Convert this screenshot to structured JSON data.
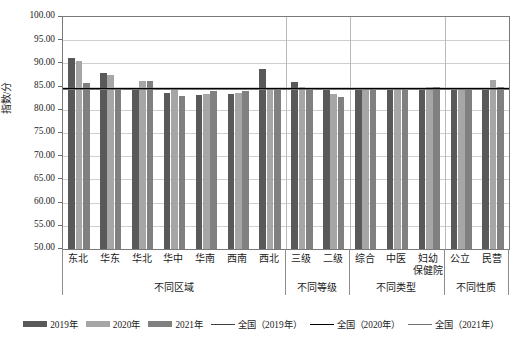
{
  "chart_data": {
    "type": "bar",
    "title": "",
    "xlabel": "",
    "ylabel": "指数/分",
    "ylim": [
      50.0,
      100.0
    ],
    "ytick_step": 5.0,
    "ytick_labels": [
      "100.00",
      "95.00",
      "90.00",
      "85.00",
      "80.00",
      "75.00",
      "70.00",
      "65.00",
      "60.00",
      "55.00",
      "50.00"
    ],
    "grid": true,
    "legend_position": "bottom",
    "categories": [
      "东北",
      "华东",
      "华北",
      "华中",
      "华南",
      "西南",
      "西北",
      "三级",
      "二级",
      "综合",
      "中医",
      "妇幼保健院",
      "公立",
      "民营"
    ],
    "series": [
      {
        "name": "2019年",
        "color": "#595959",
        "values": [
          91.1,
          87.9,
          84.7,
          83.6,
          83.1,
          83.4,
          88.9,
          86.0,
          84.4,
          84.5,
          84.4,
          84.3,
          84.4,
          84.6
        ]
      },
      {
        "name": "2020年",
        "color": "#a6a6a6",
        "values": [
          90.6,
          87.5,
          86.1,
          84.4,
          83.5,
          83.7,
          84.8,
          85.0,
          83.4,
          84.6,
          84.7,
          84.9,
          84.7,
          86.5
        ]
      },
      {
        "name": "2021年",
        "color": "#808080",
        "values": [
          85.7,
          84.6,
          86.2,
          83.0,
          84.0,
          84.1,
          84.3,
          84.7,
          82.7,
          84.6,
          84.4,
          85.0,
          84.8,
          85.0
        ]
      }
    ],
    "reference_lines": [
      {
        "name": "全国（2019年）",
        "value": 84.6,
        "color": "#404040"
      },
      {
        "name": "全国（2020年）",
        "value": 84.8,
        "color": "#000000"
      },
      {
        "name": "全国（2021年）",
        "value": 84.5,
        "color": "#737373"
      }
    ],
    "groups": [
      {
        "label": "不同区域",
        "categories": [
          "东北",
          "华东",
          "华北",
          "华中",
          "华南",
          "西南",
          "西北"
        ]
      },
      {
        "label": "不同等级",
        "categories": [
          "三级",
          "二级"
        ]
      },
      {
        "label": "不同类型",
        "categories": [
          "综合",
          "中医",
          "妇幼保健院"
        ]
      },
      {
        "label": "不同性质",
        "categories": [
          "公立",
          "民营"
        ]
      }
    ],
    "category_display": [
      "东北",
      "华东",
      "华北",
      "华中",
      "华南",
      "西南",
      "西北",
      "三级",
      "二级",
      "综合",
      "中医",
      "妇幼\n保健院",
      "公立",
      "民营"
    ]
  },
  "legend": {
    "items": [
      {
        "label": "2019年",
        "type": "bar",
        "color": "#595959"
      },
      {
        "label": "2020年",
        "type": "bar",
        "color": "#a6a6a6"
      },
      {
        "label": "2021年",
        "type": "bar",
        "color": "#808080"
      },
      {
        "label": "全国（2019年）",
        "type": "line",
        "color": "#404040"
      },
      {
        "label": "全国（2020年）",
        "type": "line",
        "color": "#000000"
      },
      {
        "label": "全国（2021年）",
        "type": "line",
        "color": "#737373"
      }
    ]
  }
}
